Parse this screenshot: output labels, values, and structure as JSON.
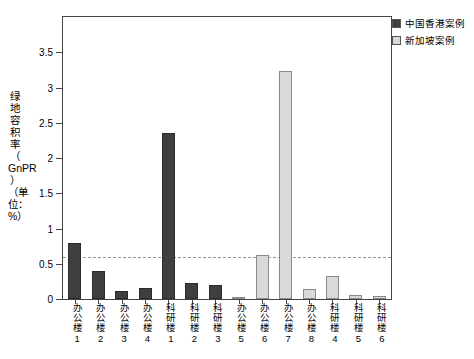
{
  "chart_data": {
    "type": "bar",
    "title": "",
    "xlabel": "",
    "ylabel": "绿地容积率（GnPR）（单位：%）",
    "ylabel_parts": [
      "绿地容积率（",
      "GnPR",
      "）（单位：%）"
    ],
    "ylim": [
      0,
      4.0
    ],
    "yticks": [
      0,
      0.5,
      1.0,
      1.5,
      2.0,
      2.5,
      3.0,
      3.5
    ],
    "ytick_labels": [
      "0",
      "0.5",
      "1",
      "1.5",
      "2",
      "2.5",
      "3",
      "3.5"
    ],
    "grid": false,
    "legend_position": "top-right",
    "threshold": {
      "value": 0.6,
      "style": "dashed",
      "color": "#999999"
    },
    "categories": [
      "办公楼1",
      "办公楼2",
      "办公楼3",
      "办公楼4",
      "科研楼1",
      "科研楼2",
      "科研楼3",
      "办公楼5",
      "办公楼6",
      "办公楼7",
      "办公楼8",
      "科研楼4",
      "科研楼5",
      "科研楼6"
    ],
    "bars": [
      {
        "label": "办公楼1",
        "value": 0.8,
        "series": "中国香港案例"
      },
      {
        "label": "办公楼2",
        "value": 0.4,
        "series": "中国香港案例"
      },
      {
        "label": "办公楼3",
        "value": 0.12,
        "series": "中国香港案例"
      },
      {
        "label": "办公楼4",
        "value": 0.15,
        "series": "中国香港案例"
      },
      {
        "label": "科研楼1",
        "value": 2.36,
        "series": "中国香港案例"
      },
      {
        "label": "科研楼2",
        "value": 0.23,
        "series": "中国香港案例"
      },
      {
        "label": "科研楼3",
        "value": 0.2,
        "series": "中国香港案例"
      },
      {
        "label": "办公楼5",
        "value": 0.02,
        "series": "新加坡案例"
      },
      {
        "label": "办公楼6",
        "value": 0.62,
        "series": "新加坡案例"
      },
      {
        "label": "办公楼7",
        "value": 3.23,
        "series": "新加坡案例"
      },
      {
        "label": "办公楼8",
        "value": 0.14,
        "series": "新加坡案例"
      },
      {
        "label": "科研楼4",
        "value": 0.33,
        "series": "新加坡案例"
      },
      {
        "label": "科研楼5",
        "value": 0.05,
        "series": "新加坡案例"
      },
      {
        "label": "科研楼6",
        "value": 0.04,
        "series": "新加坡案例"
      }
    ],
    "series": [
      {
        "name": "中国香港案例",
        "color": "#3f3f3f"
      },
      {
        "name": "新加坡案例",
        "color": "#d9d9d9"
      }
    ]
  },
  "legend": {
    "items": [
      {
        "label": "中国香港案例",
        "color": "#3f3f3f"
      },
      {
        "label": "新加坡案例",
        "color": "#d9d9d9"
      }
    ]
  }
}
